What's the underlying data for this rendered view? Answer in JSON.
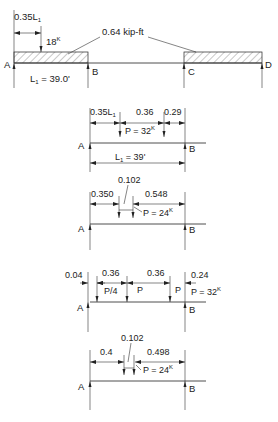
{
  "diagram": {
    "top_beam": {
      "supports": [
        "A",
        "B",
        "C",
        "D"
      ],
      "dim_load_position": "0.35L",
      "dim_load_position_sub": "1",
      "point_load": "18",
      "point_load_unit_sup": "K",
      "distributed_load": "0.64 kip-ft",
      "span_label_main": "L",
      "span_label_sub": "1",
      "span_label_value": " = 39.0'"
    },
    "case1": {
      "supports": [
        "A",
        "B"
      ],
      "dims": [
        "0.35L",
        "0.36",
        "0.29"
      ],
      "dim1_sub": "1",
      "load": "P = 32",
      "load_sup": "K",
      "span_main": "L",
      "span_sub": "1",
      "span_value": " = 39'"
    },
    "case2": {
      "supports": [
        "A",
        "B"
      ],
      "dims": [
        "0.350",
        "0.102",
        "0.548"
      ],
      "load": "P = 24",
      "load_sup": "K"
    },
    "case3": {
      "supports": [
        "A",
        "B"
      ],
      "dims": [
        "0.04",
        "0.36",
        "0.36",
        "0.24"
      ],
      "load_labels": [
        "P/4",
        "P",
        "P"
      ],
      "load": "P = 32",
      "load_sup": "K"
    },
    "case4": {
      "supports": [
        "A",
        "B"
      ],
      "dims": [
        "0.4",
        "0.102",
        "0.498"
      ],
      "load": "P = 24",
      "load_sup": "K"
    }
  }
}
